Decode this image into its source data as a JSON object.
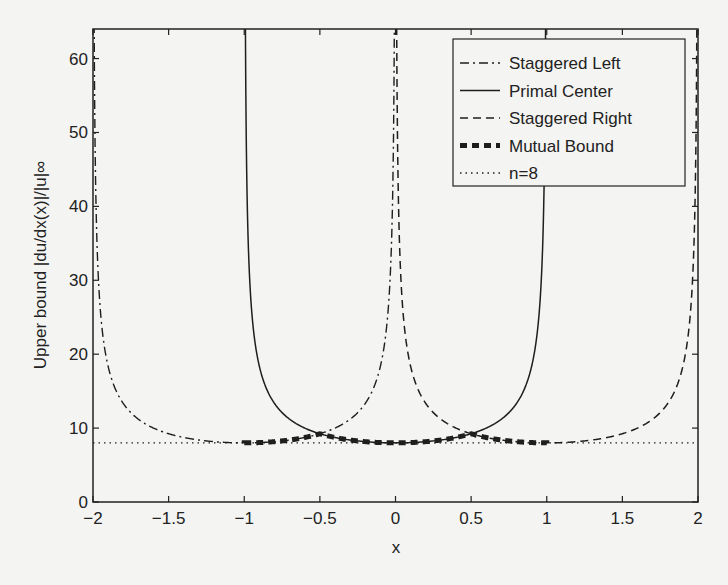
{
  "chart_data": {
    "type": "line",
    "title": "",
    "xlabel": "x",
    "ylabel": "Upper bound |du/dx(x)|/|u|∞",
    "xlim": [
      -2,
      2
    ],
    "ylim": [
      0,
      64
    ],
    "grid": false,
    "legend_position": "upper right",
    "x_ticks": [
      "−2",
      "−1.5",
      "−1",
      "−0.5",
      "0",
      "0.5",
      "1",
      "1.5",
      "2"
    ],
    "y_ticks": [
      "0",
      "10",
      "20",
      "30",
      "40",
      "50",
      "60"
    ],
    "series": [
      {
        "name": "Staggered Left",
        "style": "dash-dot",
        "domain": [
          -2,
          0
        ],
        "formula": "8/sqrt(1-(x+1)^2)",
        "x": [
          -1.99,
          -1.9,
          -1.75,
          -1.5,
          -1.25,
          -1.0,
          -0.75,
          -0.5,
          -0.25,
          -0.1,
          -0.01
        ],
        "y": [
          56.7,
          18.4,
          12.1,
          9.2,
          8.3,
          8.0,
          8.3,
          9.2,
          12.1,
          18.4,
          56.7
        ]
      },
      {
        "name": "Primal Center",
        "style": "solid",
        "domain": [
          -1,
          1
        ],
        "formula": "8/sqrt(1-x^2)",
        "x": [
          -0.99,
          -0.9,
          -0.75,
          -0.5,
          -0.25,
          0,
          0.25,
          0.5,
          0.75,
          0.9,
          0.99
        ],
        "y": [
          56.7,
          18.4,
          12.1,
          9.2,
          8.3,
          8.0,
          8.3,
          9.2,
          12.1,
          18.4,
          56.7
        ]
      },
      {
        "name": "Staggered Right",
        "style": "dashed",
        "domain": [
          0,
          2
        ],
        "formula": "8/sqrt(1-(x-1)^2)",
        "x": [
          0.01,
          0.1,
          0.25,
          0.5,
          0.75,
          1.0,
          1.25,
          1.5,
          1.75,
          1.9,
          1.99
        ],
        "y": [
          56.7,
          18.4,
          12.1,
          9.2,
          8.3,
          8.0,
          8.3,
          9.2,
          12.1,
          18.4,
          56.7
        ]
      },
      {
        "name": "Mutual Bound",
        "style": "thick-dashed",
        "domain": [
          -1,
          1
        ],
        "x": [
          -1.0,
          -0.75,
          -0.5,
          -0.25,
          0,
          0.25,
          0.5,
          0.75,
          1.0
        ],
        "y": [
          8.0,
          8.3,
          9.2,
          8.3,
          8.0,
          8.3,
          9.2,
          8.3,
          8.0
        ]
      },
      {
        "name": "n=8",
        "style": "dotted",
        "domain": [
          -2,
          2
        ],
        "x": [
          -2,
          2
        ],
        "y": [
          8,
          8
        ]
      }
    ]
  },
  "legend": {
    "items": [
      {
        "label": "Staggered Left",
        "style": "dash-dot"
      },
      {
        "label": "Primal Center",
        "style": "solid"
      },
      {
        "label": "Staggered Right",
        "style": "dashed"
      },
      {
        "label": "Mutual Bound",
        "style": "thick-dashed"
      },
      {
        "label": "n=8",
        "style": "dotted"
      }
    ]
  },
  "axes": {
    "xlabel": "x",
    "ylabel": "Upper bound |du/dx(x)|/|u|∞"
  }
}
